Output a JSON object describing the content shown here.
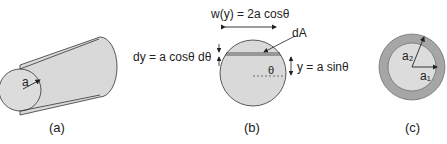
{
  "figure": {
    "panel_a": {
      "caption": "(a)",
      "radius_label": "a"
    },
    "panel_b": {
      "caption": "(b)",
      "width_label": "w(y) = 2a cosθ",
      "area_label": "dA",
      "dy_label": "dy = a cosθ dθ",
      "y_label": "y = a sinθ",
      "angle_label": "θ"
    },
    "panel_c": {
      "caption": "(c)",
      "outer_radius_label": "a₂",
      "inner_radius_label": "a₁"
    },
    "colors": {
      "fill_light": "#d9d9d9",
      "fill_dark": "#a6a6a6",
      "stroke": "#333333"
    }
  }
}
